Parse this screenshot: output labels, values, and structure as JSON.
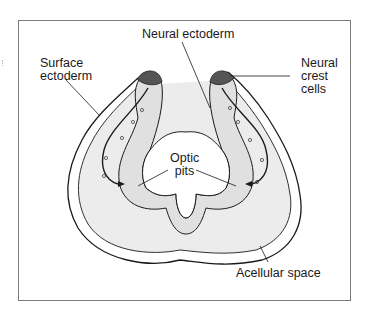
{
  "figure": {
    "labels": {
      "neural_ectoderm": "Neural ectoderm",
      "surface_ectoderm": "Surface\nectoderm",
      "neural_crest_cells": "Neural\ncrest\ncells",
      "optic_pits": "Optic\npits",
      "acellular_space": "Acellular space"
    },
    "colors": {
      "outline": "#1a1a1a",
      "fill_light": "#ebebeb",
      "fill_medium": "#d9d9d9",
      "background": "#ffffff",
      "frame": "#7a7a7a"
    }
  }
}
